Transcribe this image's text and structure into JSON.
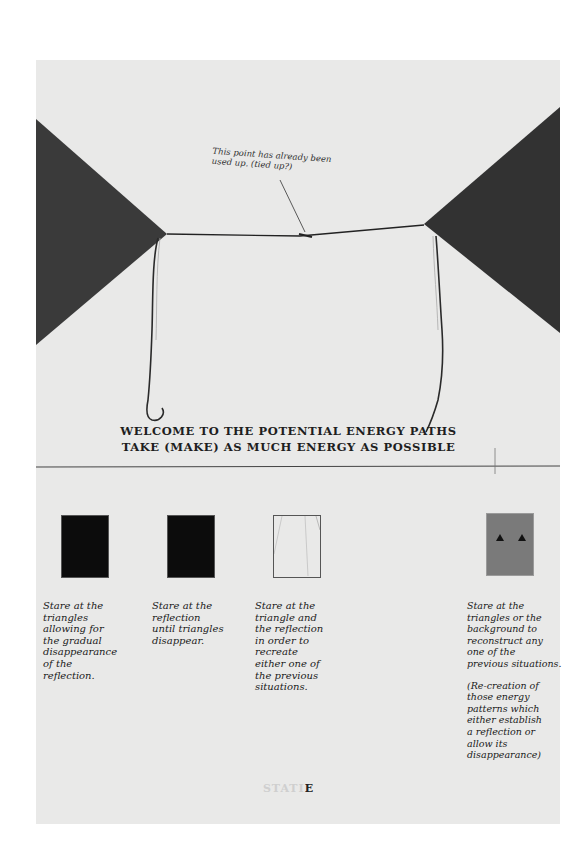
{
  "artwork": {
    "paper_color": "#e9e9e8",
    "triangle_color": "#3a3a3a",
    "annotation": {
      "line1": "This point has already been",
      "line2": "used up. (tied up?)"
    },
    "headline": {
      "line1": "WELCOME TO THE POTENTIAL ENERGY PATHS",
      "line2": "TAKE (MAKE) AS MUCH ENERGY AS POSSIBLE"
    },
    "panels": [
      {
        "swatch": "black",
        "text": [
          "Stare at the",
          "triangles",
          "allowing for",
          "the gradual",
          "disappearance",
          "of the",
          "reflection."
        ]
      },
      {
        "swatch": "black",
        "text": [
          "Stare at the",
          "reflection",
          "until triangles",
          "disappear."
        ]
      },
      {
        "swatch": "black-with-lines",
        "text": [
          "Stare at the",
          "triangle and",
          "the reflection",
          "in order to",
          "recreate",
          "either one of",
          "the previous",
          "situations."
        ]
      },
      {
        "swatch": "gray-with-two-triangles",
        "text": [
          "Stare at the",
          "triangles or the",
          "background to",
          "reconstruct any",
          "one of the",
          "previous situations."
        ],
        "note": [
          "(Re-creation of",
          "those energy",
          "patterns which",
          "either establish",
          "a reflection or",
          "allow its",
          "disappearance)"
        ]
      }
    ],
    "stamp": {
      "faded": "STAT",
      "solid_pre": "I",
      "solid": "E"
    }
  }
}
